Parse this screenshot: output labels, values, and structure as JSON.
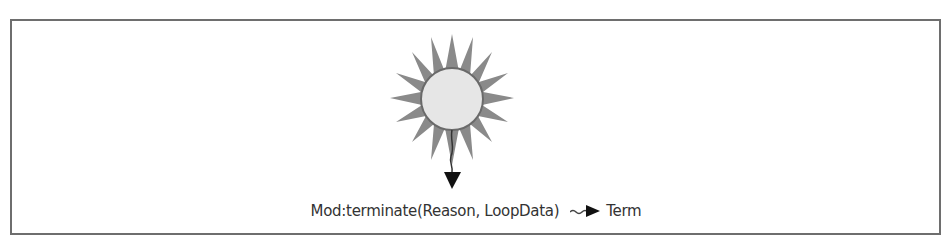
{
  "diagram": {
    "type": "state",
    "state": {
      "shape": "sun",
      "label": ""
    },
    "transition": {
      "callback": "Mod:terminate(Reason, LoopData)",
      "result": "Term"
    },
    "colors": {
      "frame": "#6e6e6e",
      "rays": "#8a8a8a",
      "circle_fill": "#e6e6e6",
      "circle_stroke": "#6a6a6a",
      "arrow": "#111111",
      "text": "#333333"
    }
  }
}
